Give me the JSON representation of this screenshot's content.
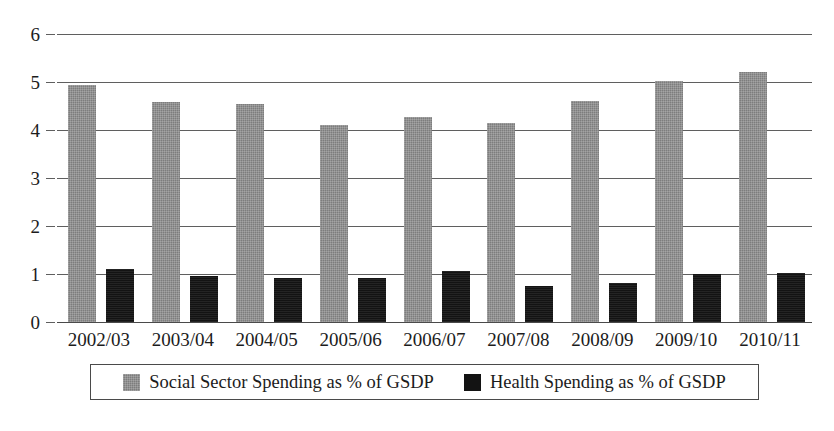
{
  "chart_data": {
    "type": "bar",
    "title": "",
    "subtitle": "",
    "xlabel": "",
    "ylabel": "",
    "ylim": [
      0,
      6
    ],
    "yticks": [
      0,
      1,
      2,
      3,
      4,
      5,
      6
    ],
    "ytick_labels": [
      "0",
      "1",
      "2",
      "3",
      "4",
      "5",
      "6"
    ],
    "grid": true,
    "grid_axis": "y",
    "legend_position": "bottom",
    "categories": [
      "2002/03",
      "2003/04",
      "2004/05",
      "2005/06",
      "2006/07",
      "2007/08",
      "2008/09",
      "2009/10",
      "2010/11"
    ],
    "series": [
      {
        "name": "Social Sector Spending as % of GSDP",
        "color": "#7d7d7d",
        "values": [
          4.94,
          4.58,
          4.55,
          4.1,
          4.28,
          4.15,
          4.6,
          5.03,
          5.2
        ]
      },
      {
        "name": "Health Spending as % of GSDP",
        "color": "#131313",
        "values": [
          1.11,
          0.95,
          0.92,
          0.92,
          1.06,
          0.76,
          0.82,
          1.0,
          1.03
        ]
      }
    ]
  },
  "legend": {
    "entries": [
      {
        "label": "Social Sector Spending as % of GSDP",
        "swatch": "gray-swatch"
      },
      {
        "label": "Health Spending as % of GSDP",
        "swatch": "black-swatch"
      }
    ]
  }
}
